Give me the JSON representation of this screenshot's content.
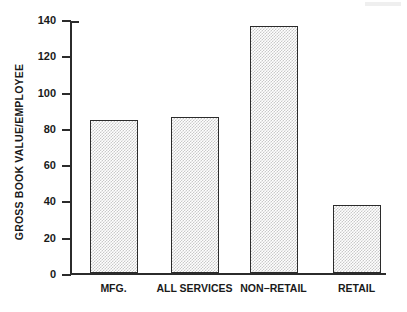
{
  "chart_data": {
    "type": "bar",
    "title": "",
    "xlabel": "",
    "ylabel": "GROSS BOOK VALUE/EMPLOYEE",
    "categories": [
      "MFG.",
      "ALL SERVICES",
      "NON−RETAIL",
      "RETAIL"
    ],
    "values": [
      85,
      86.5,
      137,
      38
    ],
    "ylim": [
      0,
      140
    ],
    "yticks": [
      0,
      20,
      40,
      60,
      80,
      100,
      120,
      140
    ],
    "ytick_labels": [
      "0",
      "20",
      "40",
      "60",
      "80",
      "100",
      "120",
      "140"
    ],
    "grid": false,
    "legend": null,
    "bar_fill": "#c9c9c9",
    "bar_edge": "#2b2b2b",
    "axis_color": "#2b2b2b",
    "background": "#ffffff"
  }
}
